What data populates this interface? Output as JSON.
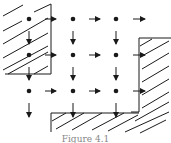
{
  "figure": {
    "caption": "Figure 4.1",
    "colors": {
      "ink": "#1a1a1a",
      "background": "#ffffff"
    }
  },
  "grid": {
    "columns_x": [
      29,
      73,
      116
    ],
    "rows_y": [
      19,
      55,
      91
    ],
    "dot_radius": 2.3
  },
  "arrows": {
    "right": [
      {
        "x1": 45,
        "y": 19,
        "x2": 56
      },
      {
        "x1": 89,
        "y": 19,
        "x2": 100
      },
      {
        "x1": 133,
        "y": 19,
        "x2": 145
      },
      {
        "x1": 45,
        "y": 55,
        "x2": 56
      },
      {
        "x1": 89,
        "y": 55,
        "x2": 100
      },
      {
        "x1": 133,
        "y": 55,
        "x2": 145
      },
      {
        "x1": 45,
        "y": 91,
        "x2": 56
      },
      {
        "x1": 89,
        "y": 91,
        "x2": 100
      },
      {
        "x1": 133,
        "y": 91,
        "x2": 145
      }
    ],
    "down": [
      {
        "x": 29,
        "y1": 31,
        "y2": 44
      },
      {
        "x": 73,
        "y1": 31,
        "y2": 44
      },
      {
        "x": 116,
        "y1": 31,
        "y2": 44
      },
      {
        "x": 29,
        "y1": 67,
        "y2": 80
      },
      {
        "x": 73,
        "y1": 67,
        "y2": 80
      },
      {
        "x": 116,
        "y1": 67,
        "y2": 80
      },
      {
        "x": 29,
        "y1": 103,
        "y2": 117
      },
      {
        "x": 73,
        "y1": 103,
        "y2": 117
      },
      {
        "x": 116,
        "y1": 103,
        "y2": 117
      }
    ]
  },
  "obstacles": [
    {
      "name": "top-left-obstacle",
      "boundary": "51,5 51,74 5,74"
    },
    {
      "name": "right-obstacle",
      "boundary": "139,38 171,38 171,143 139,143"
    },
    {
      "name": "bottom-obstacle",
      "boundary": "51,143 51,113 139,113"
    }
  ]
}
